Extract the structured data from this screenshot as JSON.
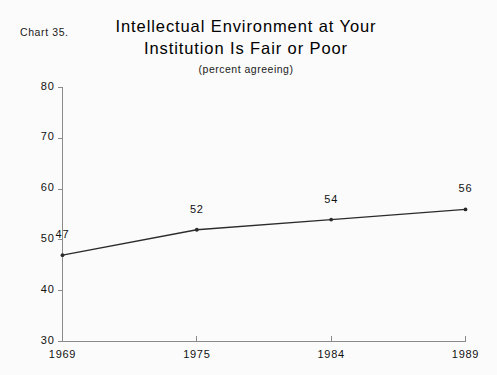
{
  "chart_number": "Chart 35.",
  "title_lines": [
    "Intellectual Environment at Your",
    "Institution Is Fair or Poor"
  ],
  "subtitle": "(percent agreeing)",
  "chart_data": {
    "type": "line",
    "title": "Intellectual Environment at Your Institution Is Fair or Poor",
    "subtitle": "(percent agreeing)",
    "xlabel": "",
    "ylabel": "",
    "categories": [
      "1969",
      "1975",
      "1984",
      "1989"
    ],
    "values": [
      47,
      52,
      54,
      56
    ],
    "point_labels": [
      "47",
      "52",
      "54",
      "56"
    ],
    "ylim": [
      30,
      80
    ],
    "yticks": [
      30,
      40,
      50,
      60,
      70,
      80
    ],
    "ytick_labels": [
      "30",
      "40",
      "50",
      "60",
      "70",
      "80"
    ],
    "xtick_labels": [
      "1969",
      "1975",
      "1984",
      "1989"
    ],
    "grid": false,
    "legend": "none",
    "series": [
      {
        "name": "percent agreeing",
        "values": [
          47,
          52,
          54,
          56
        ],
        "color": "#2b2b2b"
      }
    ]
  },
  "colors": {
    "background": "#fbfbfb",
    "axis": "#8a8a8a",
    "line": "#2b2b2b",
    "text": "#111111"
  }
}
